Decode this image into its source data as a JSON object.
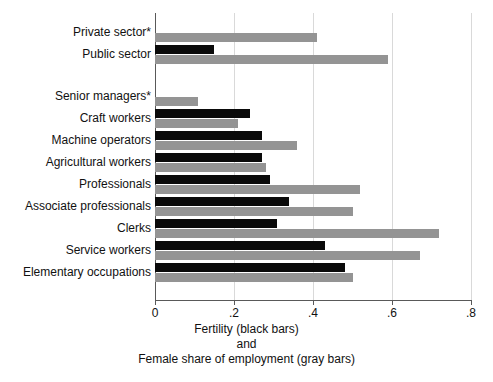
{
  "chart_data": {
    "type": "bar",
    "orientation": "horizontal",
    "title": "",
    "xlabel_lines": [
      "Fertility (black bars)",
      "and",
      "Female share of employment (gray bars)"
    ],
    "ylabel": "",
    "xlim": [
      0,
      0.8
    ],
    "xticks": [
      "0",
      ".2",
      ".4",
      ".6",
      ".8"
    ],
    "xtick_values": [
      0,
      0.2,
      0.4,
      0.6,
      0.8
    ],
    "grid": true,
    "grid_axis": "x",
    "legend": "inline-in-axis-title",
    "series": [
      {
        "name": "Fertility (black bars)",
        "color": "#0a0a0a",
        "values": [
          null,
          0.15,
          null,
          0.24,
          0.27,
          0.27,
          0.29,
          0.34,
          0.31,
          0.43,
          0.48
        ]
      },
      {
        "name": "Female share of employment (gray bars)",
        "color": "#949494",
        "values": [
          0.41,
          0.59,
          0.11,
          0.21,
          0.36,
          0.28,
          0.52,
          0.5,
          0.72,
          0.67,
          0.5
        ]
      }
    ],
    "categories": [
      "Private sector*",
      "Public sector",
      "Senior managers*",
      "Craft workers",
      "Machine operators",
      "Agricultural workers",
      "Professionals",
      "Associate professionals",
      "Clerks",
      "Service workers",
      "Elementary occupations"
    ],
    "group_gap_after_index": 1
  },
  "axis": {
    "xticks": [
      {
        "label": "0",
        "value": 0
      },
      {
        "label": ".2",
        "value": 0.2
      },
      {
        "label": ".4",
        "value": 0.4
      },
      {
        "label": ".6",
        "value": 0.6
      },
      {
        "label": ".8",
        "value": 0.8
      }
    ],
    "xtitle": {
      "line1": "Fertility (black bars)",
      "line2": "and",
      "line3": "Female share of employment (gray bars)"
    }
  },
  "rows": [
    {
      "label": "Private sector*",
      "black": null,
      "gray": 0.41
    },
    {
      "label": "Public sector",
      "black": 0.15,
      "gray": 0.59
    },
    {
      "label": "Senior managers*",
      "black": null,
      "gray": 0.11
    },
    {
      "label": "Craft workers",
      "black": 0.24,
      "gray": 0.21
    },
    {
      "label": "Machine operators",
      "black": 0.27,
      "gray": 0.36
    },
    {
      "label": "Agricultural workers",
      "black": 0.27,
      "gray": 0.28
    },
    {
      "label": "Professionals",
      "black": 0.29,
      "gray": 0.52
    },
    {
      "label": "Associate professionals",
      "black": 0.34,
      "gray": 0.5
    },
    {
      "label": "Clerks",
      "black": 0.31,
      "gray": 0.72
    },
    {
      "label": "Service workers",
      "black": 0.43,
      "gray": 0.67
    },
    {
      "label": "Elementary occupations",
      "black": 0.48,
      "gray": 0.5
    }
  ],
  "colors": {
    "black_bar": "#0a0a0a",
    "gray_bar": "#949494",
    "gridline": "#d9d9d9",
    "axis": "#595959",
    "background": "#ffffff"
  }
}
